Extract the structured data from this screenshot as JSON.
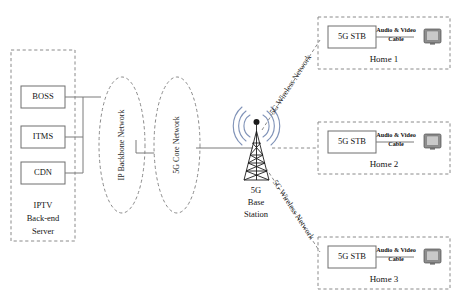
{
  "diagram": {
    "backend_group": {
      "label_lines": [
        "IPTV",
        "Back-end",
        "Server"
      ],
      "nodes": [
        {
          "label": "BOSS",
          "name": "boss-node"
        },
        {
          "label": "ITMS",
          "name": "itms-node"
        },
        {
          "label": "CDN",
          "name": "cdn-node"
        }
      ]
    },
    "clouds": [
      {
        "label": "IP Backbone Network",
        "name": "ip-backbone-network-cloud"
      },
      {
        "label": "5G Core Network",
        "name": "5g-core-network-cloud"
      }
    ],
    "base_station": {
      "label_lines": [
        "5G",
        "Base",
        "Station"
      ],
      "icon": "cell-tower-icon"
    },
    "wireless_links": [
      {
        "label": "5G Wireless Network",
        "name": "wireless-link-upper"
      },
      {
        "label": "5G Wireless Network",
        "name": "wireless-link-lower"
      }
    ],
    "homes": [
      {
        "name": "home-1",
        "title": "Home 1",
        "stb_label": "5G STB",
        "cable_lines": [
          "Audio & Video",
          "Cable"
        ],
        "tv_icon": "television-icon"
      },
      {
        "name": "home-2",
        "title": "Home 2",
        "stb_label": "5G STB",
        "cable_lines": [
          "Audio & Video",
          "Cable"
        ],
        "tv_icon": "television-icon"
      },
      {
        "name": "home-3",
        "title": "Home 3",
        "stb_label": "5G STB",
        "cable_lines": [
          "Audio & Video",
          "Cable"
        ],
        "tv_icon": "television-icon"
      }
    ],
    "colors": {
      "signal_arc": "#8093b8",
      "box_stroke": "#6e6e6e",
      "dashed_stroke": "#8a8a8a",
      "connector": "#7a7a7a",
      "tv_body": "#8e8e8e"
    }
  }
}
